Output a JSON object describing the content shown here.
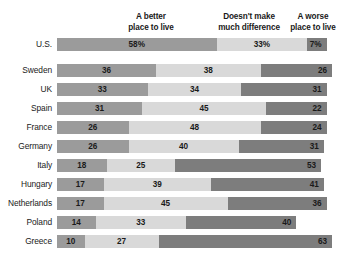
{
  "headers": {
    "better": {
      "line1": "A better",
      "line2": "place to live"
    },
    "nodiff": {
      "line1": "Doesn't make",
      "line2": "much difference"
    },
    "worse": {
      "line1": "A worse",
      "line2": "place to live"
    }
  },
  "colors": {
    "better": "#9b9b9b",
    "nodiff": "#d9d9d9",
    "worse": "#7d7d7d",
    "text": "#1a1a1a",
    "background": "#ffffff"
  },
  "chart_data": {
    "type": "bar",
    "subtype": "stacked-horizontal-100",
    "title": "",
    "xlabel": "",
    "ylabel": "",
    "xlim": [
      0,
      100
    ],
    "grid": false,
    "legend_position": "top",
    "categories": [
      "U.S.",
      "Sweden",
      "UK",
      "Spain",
      "France",
      "Germany",
      "Italy",
      "Hungary",
      "Netherlands",
      "Poland",
      "Greece"
    ],
    "series": [
      {
        "name": "A better place to live",
        "values": [
          58,
          36,
          33,
          31,
          26,
          26,
          18,
          17,
          17,
          14,
          10
        ]
      },
      {
        "name": "Doesn't make much difference",
        "values": [
          33,
          38,
          34,
          45,
          48,
          40,
          25,
          39,
          45,
          33,
          27
        ]
      },
      {
        "name": "A worse place to live",
        "values": [
          7,
          26,
          31,
          22,
          24,
          31,
          53,
          41,
          36,
          40,
          63
        ]
      }
    ],
    "rows": [
      {
        "country": "U.S.",
        "better": 58,
        "nodiff": 33,
        "worse": 7,
        "better_label": "58%",
        "nodiff_label": "33%",
        "worse_label": "7%"
      },
      {
        "country": "Sweden",
        "better": 36,
        "nodiff": 38,
        "worse": 26,
        "better_label": "36",
        "nodiff_label": "38",
        "worse_label": "26"
      },
      {
        "country": "UK",
        "better": 33,
        "nodiff": 34,
        "worse": 31,
        "better_label": "33",
        "nodiff_label": "34",
        "worse_label": "31"
      },
      {
        "country": "Spain",
        "better": 31,
        "nodiff": 45,
        "worse": 22,
        "better_label": "31",
        "nodiff_label": "45",
        "worse_label": "22"
      },
      {
        "country": "France",
        "better": 26,
        "nodiff": 48,
        "worse": 24,
        "better_label": "26",
        "nodiff_label": "48",
        "worse_label": "24"
      },
      {
        "country": "Germany",
        "better": 26,
        "nodiff": 40,
        "worse": 31,
        "better_label": "26",
        "nodiff_label": "40",
        "worse_label": "31"
      },
      {
        "country": "Italy",
        "better": 18,
        "nodiff": 25,
        "worse": 53,
        "better_label": "18",
        "nodiff_label": "25",
        "worse_label": "53"
      },
      {
        "country": "Hungary",
        "better": 17,
        "nodiff": 39,
        "worse": 41,
        "better_label": "17",
        "nodiff_label": "39",
        "worse_label": "41"
      },
      {
        "country": "Netherlands",
        "better": 17,
        "nodiff": 45,
        "worse": 36,
        "better_label": "17",
        "nodiff_label": "45",
        "worse_label": "36"
      },
      {
        "country": "Poland",
        "better": 14,
        "nodiff": 33,
        "worse": 40,
        "better_label": "14",
        "nodiff_label": "33",
        "worse_label": "40"
      },
      {
        "country": "Greece",
        "better": 10,
        "nodiff": 27,
        "worse": 63,
        "better_label": "10",
        "nodiff_label": "27",
        "worse_label": "63"
      }
    ]
  }
}
